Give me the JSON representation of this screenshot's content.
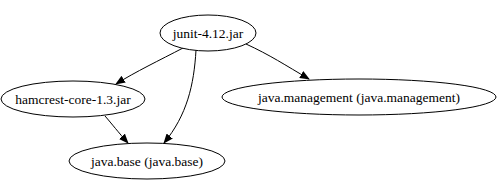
{
  "diagram": {
    "type": "dependency-graph",
    "nodes": [
      {
        "id": "junit",
        "label": "junit-4.12.jar",
        "cx": 208,
        "cy": 33,
        "rx": 48,
        "ry": 18
      },
      {
        "id": "hamcrest",
        "label": "hamcrest-core-1.3.jar",
        "cx": 73,
        "cy": 99,
        "rx": 72,
        "ry": 18
      },
      {
        "id": "management",
        "label": "java.management (java.management)",
        "cx": 359,
        "cy": 97,
        "rx": 137,
        "ry": 18
      },
      {
        "id": "base",
        "label": "java.base (java.base)",
        "cx": 147,
        "cy": 161,
        "rx": 78,
        "ry": 18
      }
    ],
    "edges": [
      {
        "from": "junit",
        "to": "hamcrest"
      },
      {
        "from": "junit",
        "to": "management"
      },
      {
        "from": "junit",
        "to": "base"
      },
      {
        "from": "hamcrest",
        "to": "base"
      }
    ],
    "colors": {
      "stroke": "#000000",
      "background": "#ffffff",
      "text": "#000000"
    }
  }
}
